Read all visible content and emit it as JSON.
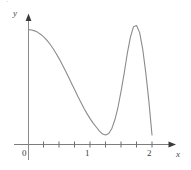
{
  "figure": {
    "background_color": "#ffffff",
    "curve_color": "#8b8b8b",
    "axis_color": "#7a7a7a",
    "width": 191,
    "height": 170,
    "clipped_header_text": "."
  },
  "axes": {
    "x_label": "x",
    "y_label": "y",
    "x_tick_labels": [
      "0",
      "1",
      "2"
    ],
    "x_tick_values": [
      0,
      1,
      2
    ],
    "x_minor_tick_values": [
      0.25,
      0.5,
      0.75,
      1.25,
      1.5,
      1.75
    ],
    "y_tick_labels": [],
    "grid": "off",
    "legend": "none"
  },
  "chart_data": {
    "type": "line",
    "title": "",
    "subtitle": "",
    "xlabel": "x",
    "ylabel": "y",
    "xlim": [
      -0.07,
      2.35
    ],
    "ylim": [
      0,
      2.05
    ],
    "grid": false,
    "legend_position": "none",
    "axis_ticks": {
      "x_major": [
        0,
        1,
        2
      ],
      "x_major_labels": [
        "0",
        "1",
        "2"
      ],
      "x_minor": [
        0.25,
        0.5,
        0.75,
        1.25,
        1.5,
        1.75
      ],
      "y_major": [],
      "y_major_labels": []
    },
    "annotations": [
      {
        "name": "y-intercept",
        "x": 0.0,
        "y": 1.93
      },
      {
        "name": "local-minimum",
        "x": 1.17,
        "y": 0.15
      },
      {
        "name": "global-maximum",
        "x": 1.7,
        "y": 2.0
      },
      {
        "name": "right-endpoint",
        "x": 2.0,
        "y": 0.15
      }
    ],
    "series": [
      {
        "name": "curve",
        "color": "#8b8b8b",
        "x": [
          0.0,
          0.05,
          0.1,
          0.15,
          0.2,
          0.25,
          0.3,
          0.35,
          0.4,
          0.45,
          0.5,
          0.55,
          0.6,
          0.65,
          0.7,
          0.75,
          0.8,
          0.85,
          0.9,
          0.95,
          1.0,
          1.05,
          1.1,
          1.15,
          1.2,
          1.25,
          1.3,
          1.35,
          1.4,
          1.45,
          1.5,
          1.55,
          1.6,
          1.65,
          1.7,
          1.75,
          1.8,
          1.85,
          1.9,
          1.95,
          2.0
        ],
        "y": [
          1.93,
          1.925,
          1.91,
          1.885,
          1.85,
          1.805,
          1.75,
          1.685,
          1.61,
          1.525,
          1.435,
          1.335,
          1.235,
          1.13,
          1.02,
          0.915,
          0.805,
          0.705,
          0.605,
          0.515,
          0.43,
          0.355,
          0.29,
          0.225,
          0.175,
          0.16,
          0.185,
          0.27,
          0.42,
          0.63,
          0.9,
          1.2,
          1.53,
          1.8,
          1.98,
          2.0,
          1.88,
          1.6,
          1.2,
          0.72,
          0.16
        ]
      }
    ]
  }
}
